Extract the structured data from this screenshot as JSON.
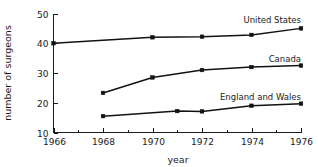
{
  "chart_data": {
    "type": "line",
    "title": "",
    "xlabel": "year",
    "ylabel": "number of surgeons",
    "xlim": [
      1966,
      1976
    ],
    "ylim": [
      10,
      50
    ],
    "grid": false,
    "legend_position": "inline-right",
    "x_ticks_major": [
      1966,
      1968,
      1970,
      1972,
      1974,
      1976
    ],
    "x_ticks_major_labels": [
      "1966",
      "1968",
      "1970",
      "1972",
      "1974",
      "1976"
    ],
    "x_ticks_minor": [
      1967,
      1969,
      1971,
      1973,
      1975
    ],
    "y_ticks": [
      10,
      20,
      30,
      40,
      50
    ],
    "y_ticks_labels": [
      "10",
      "20",
      "30",
      "40",
      "50"
    ],
    "series": [
      {
        "name": "United States",
        "label": "United States",
        "x": [
          1966,
          1970,
          1972,
          1974,
          1976
        ],
        "values": [
          40.0,
          42.0,
          42.2,
          42.8,
          45.0
        ],
        "color": "#121212"
      },
      {
        "name": "Canada",
        "label": "Canada",
        "x": [
          1968,
          1970,
          1972,
          1974,
          1976
        ],
        "values": [
          23.3,
          28.5,
          31.0,
          32.0,
          32.5
        ],
        "color": "#121212"
      },
      {
        "name": "England and Wales",
        "label": "England and Wales",
        "x": [
          1968,
          1971,
          1972,
          1974,
          1976
        ],
        "values": [
          15.5,
          17.2,
          17.1,
          19.0,
          19.7
        ],
        "color": "#121212"
      }
    ]
  },
  "labels": {
    "xlabel": "year",
    "ylabel": "number of surgeons",
    "series_us": "United States",
    "series_ca": "Canada",
    "series_ew": "England and Wales"
  }
}
